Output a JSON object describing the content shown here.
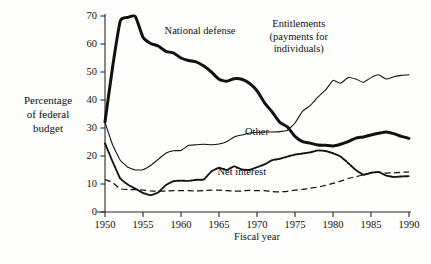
{
  "chart_data": {
    "type": "line",
    "title": "",
    "xlabel": "Fiscal year",
    "ylabel": "Percentage of federal budget",
    "ylabel_lines": [
      "Percentage",
      "of federal",
      "budget"
    ],
    "xlim": [
      1950,
      1990
    ],
    "ylim": [
      0,
      70
    ],
    "yticks": [
      0,
      10,
      20,
      30,
      40,
      50,
      60,
      70
    ],
    "ytick_labels": [
      "0",
      "10",
      "20",
      "30",
      "40",
      "50",
      "60",
      "70"
    ],
    "xticks": [
      1950,
      1955,
      1960,
      1965,
      1970,
      1975,
      1980,
      1985,
      1990
    ],
    "xtick_labels": [
      "1950",
      "1955",
      "1960",
      "1965",
      "1970",
      "1975",
      "1980",
      "1985",
      "1990"
    ],
    "grid": false,
    "legend_position": "inline-annotations",
    "x": [
      1950,
      1951,
      1952,
      1953,
      1954,
      1955,
      1956,
      1957,
      1958,
      1959,
      1960,
      1961,
      1962,
      1963,
      1964,
      1965,
      1966,
      1967,
      1968,
      1969,
      1970,
      1971,
      1972,
      1973,
      1974,
      1975,
      1976,
      1977,
      1978,
      1979,
      1980,
      1981,
      1982,
      1983,
      1984,
      1985,
      1986,
      1987,
      1988,
      1989,
      1990
    ],
    "series": [
      {
        "name": "National defense",
        "style": "thick-solid",
        "label": "National defense",
        "label_x": 1962.5,
        "label_y": 63.5,
        "values": [
          32.2,
          51.8,
          68.1,
          69.5,
          69.8,
          62.4,
          60.2,
          59.3,
          57.4,
          56.8,
          55.0,
          54.1,
          53.6,
          52.1,
          50.0,
          47.4,
          46.7,
          47.6,
          47.4,
          46.0,
          43.3,
          39.0,
          35.7,
          32.0,
          30.4,
          27.0,
          25.1,
          24.6,
          23.9,
          23.8,
          23.6,
          24.2,
          25.1,
          26.4,
          26.8,
          27.5,
          28.1,
          28.6,
          28.0,
          27.0,
          26.3
        ]
      },
      {
        "name": "Entitlements (payments for individuals)",
        "style": "thin-solid",
        "label": "Entitlements (payments for individuals)",
        "label_x": 1975.5,
        "label_y": 66.0,
        "values": [
          32.0,
          24.0,
          18.5,
          16.0,
          15.0,
          15.1,
          16.6,
          18.8,
          21.0,
          21.9,
          22.0,
          23.8,
          24.0,
          24.2,
          24.0,
          24.3,
          25.1,
          26.8,
          27.5,
          28.2,
          28.5,
          28.6,
          28.6,
          28.7,
          29.2,
          31.8,
          36.0,
          38.0,
          41.0,
          43.5,
          47.0,
          46.0,
          48.0,
          47.5,
          46.3,
          48.0,
          49.0,
          47.5,
          48.3,
          48.8,
          49.0
        ]
      },
      {
        "name": "Other",
        "style": "dotted",
        "label": "Other",
        "label_x": 1970.0,
        "label_y": 27.5,
        "values": [
          24.5,
          18.0,
          12.0,
          9.8,
          8.3,
          6.8,
          6.0,
          7.0,
          9.6,
          11.0,
          11.2,
          11.1,
          11.5,
          11.6,
          14.5,
          15.8,
          15.0,
          16.3,
          15.2,
          15.0,
          16.0,
          17.0,
          18.5,
          19.0,
          19.8,
          20.5,
          20.9,
          21.3,
          22.0,
          21.8,
          21.0,
          19.8,
          17.5,
          15.0,
          13.3,
          14.0,
          14.3,
          13.0,
          12.5,
          12.7,
          12.8
        ]
      },
      {
        "name": "Net interest",
        "style": "dashed",
        "label": "Net interest",
        "label_x": 1968.0,
        "label_y": 13.2,
        "values": [
          11.6,
          10.5,
          8.3,
          8.0,
          8.0,
          7.8,
          7.5,
          7.5,
          7.5,
          7.6,
          7.6,
          7.6,
          7.5,
          7.6,
          7.8,
          7.8,
          7.6,
          7.5,
          7.5,
          7.7,
          7.6,
          7.6,
          7.3,
          7.2,
          7.4,
          7.8,
          8.1,
          8.5,
          8.9,
          9.5,
          10.2,
          11.0,
          12.0,
          12.6,
          13.3,
          14.0,
          14.2,
          13.9,
          14.0,
          14.2,
          14.3
        ]
      }
    ]
  }
}
